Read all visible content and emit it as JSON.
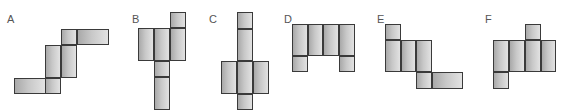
{
  "figures": [
    {
      "label": "A",
      "label_pos": [
        7,
        14
      ],
      "cells": [
        {
          "x": 61,
          "y": 29,
          "w": 16,
          "h": 16
        },
        {
          "x": 77,
          "y": 29,
          "w": 32,
          "h": 16
        },
        {
          "x": 45,
          "y": 45,
          "w": 16,
          "h": 33
        },
        {
          "x": 61,
          "y": 45,
          "w": 16,
          "h": 33
        },
        {
          "x": 14,
          "y": 78,
          "w": 32,
          "h": 16
        },
        {
          "x": 45,
          "y": 78,
          "w": 16,
          "h": 16
        }
      ]
    },
    {
      "label": "B",
      "label_pos": [
        132,
        14
      ],
      "cells": [
        {
          "x": 170,
          "y": 12,
          "w": 16,
          "h": 16
        },
        {
          "x": 138,
          "y": 28,
          "w": 16,
          "h": 33
        },
        {
          "x": 154,
          "y": 28,
          "w": 16,
          "h": 33
        },
        {
          "x": 170,
          "y": 28,
          "w": 16,
          "h": 33
        },
        {
          "x": 154,
          "y": 61,
          "w": 16,
          "h": 16
        },
        {
          "x": 154,
          "y": 77,
          "w": 16,
          "h": 33
        }
      ]
    },
    {
      "label": "C",
      "label_pos": [
        209,
        14
      ],
      "cells": [
        {
          "x": 237,
          "y": 12,
          "w": 16,
          "h": 17
        },
        {
          "x": 237,
          "y": 29,
          "w": 16,
          "h": 32
        },
        {
          "x": 221,
          "y": 61,
          "w": 16,
          "h": 33
        },
        {
          "x": 237,
          "y": 61,
          "w": 16,
          "h": 33
        },
        {
          "x": 253,
          "y": 61,
          "w": 16,
          "h": 33
        },
        {
          "x": 237,
          "y": 94,
          "w": 16,
          "h": 16
        }
      ]
    },
    {
      "label": "D",
      "label_pos": [
        284,
        14
      ],
      "cells": [
        {
          "x": 292,
          "y": 24,
          "w": 16,
          "h": 32
        },
        {
          "x": 308,
          "y": 24,
          "w": 15,
          "h": 32
        },
        {
          "x": 323,
          "y": 24,
          "w": 16,
          "h": 32
        },
        {
          "x": 339,
          "y": 24,
          "w": 16,
          "h": 32
        },
        {
          "x": 292,
          "y": 56,
          "w": 16,
          "h": 16
        },
        {
          "x": 339,
          "y": 56,
          "w": 16,
          "h": 16
        }
      ]
    },
    {
      "label": "E",
      "label_pos": [
        377,
        14
      ],
      "cells": [
        {
          "x": 385,
          "y": 24,
          "w": 16,
          "h": 16
        },
        {
          "x": 385,
          "y": 40,
          "w": 16,
          "h": 32
        },
        {
          "x": 401,
          "y": 40,
          "w": 15,
          "h": 32
        },
        {
          "x": 416,
          "y": 40,
          "w": 16,
          "h": 32
        },
        {
          "x": 416,
          "y": 72,
          "w": 16,
          "h": 17
        },
        {
          "x": 432,
          "y": 72,
          "w": 31,
          "h": 17
        }
      ]
    },
    {
      "label": "F",
      "label_pos": [
        485,
        14
      ],
      "cells": [
        {
          "x": 525,
          "y": 24,
          "w": 16,
          "h": 16
        },
        {
          "x": 493,
          "y": 40,
          "w": 16,
          "h": 32
        },
        {
          "x": 509,
          "y": 40,
          "w": 16,
          "h": 32
        },
        {
          "x": 525,
          "y": 40,
          "w": 16,
          "h": 32
        },
        {
          "x": 541,
          "y": 40,
          "w": 15,
          "h": 32
        },
        {
          "x": 493,
          "y": 72,
          "w": 16,
          "h": 17
        }
      ]
    }
  ],
  "colors": {
    "border": "#3a3a3a",
    "fill_dark": "#a9a9a9",
    "fill_light": "#e2e2e2",
    "label": "#555555"
  }
}
